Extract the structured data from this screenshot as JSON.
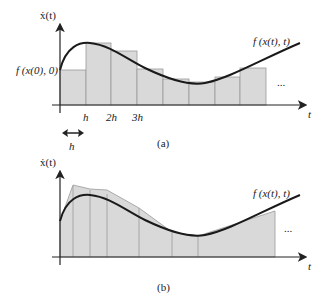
{
  "panel_a": {
    "caption": "(a)",
    "y_axis_label": "ẋ(t)",
    "x_axis_label": "t",
    "initial_label": "f (x(0), 0)",
    "curve_label": "f (x(t), t)",
    "ticks": [
      "h",
      "2h",
      "3h"
    ],
    "step_label": "h",
    "ellipsis": "..."
  },
  "panel_b": {
    "caption": "(b)",
    "y_axis_label": "ẋ(t)",
    "x_axis_label": "t",
    "curve_label": "f (x(t), t)",
    "ellipsis": "..."
  },
  "colors": {
    "fill": "#d9d9d9",
    "edge": "#999999",
    "curve": "#1a1a1a",
    "axis": "#222222"
  }
}
